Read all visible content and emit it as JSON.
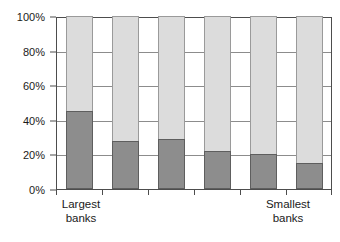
{
  "chart_data": {
    "type": "bar",
    "subtype": "stacked-bar-100-percent",
    "title": "",
    "subtitle": "",
    "xlabel": "",
    "ylabel": "",
    "ylim": [
      0,
      100
    ],
    "yticks": [
      0,
      20,
      40,
      60,
      80,
      100
    ],
    "ytick_labels": [
      "0%",
      "20%",
      "40%",
      "60%",
      "80%",
      "100%"
    ],
    "grid": true,
    "legend": "none",
    "categories": [
      "1",
      "2",
      "3",
      "4",
      "5",
      "6"
    ],
    "category_endpoint_labels": {
      "left": [
        "Largest",
        "banks"
      ],
      "right": [
        "Smallest",
        "banks"
      ]
    },
    "series": [
      {
        "name": "lower-segment",
        "color": "#8d8d8d",
        "values": [
          45,
          28,
          29,
          22,
          20,
          15
        ]
      },
      {
        "name": "upper-segment",
        "color": "#dcdcdc",
        "values": [
          55,
          72,
          71,
          78,
          80,
          85
        ]
      }
    ],
    "bars": [
      {
        "category": "1",
        "lower": 45,
        "upper": 55
      },
      {
        "category": "2",
        "lower": 28,
        "upper": 72
      },
      {
        "category": "3",
        "lower": 29,
        "upper": 71
      },
      {
        "category": "4",
        "lower": 22,
        "upper": 78
      },
      {
        "category": "5",
        "lower": 20,
        "upper": 80
      },
      {
        "category": "6",
        "lower": 15,
        "upper": 85
      }
    ]
  },
  "axis": {
    "y_labels": [
      "100%",
      "80%",
      "60%",
      "40%",
      "20%",
      "0%"
    ]
  },
  "labels": {
    "left_line1": "Largest",
    "left_line2": "banks",
    "right_line1": "Smallest",
    "right_line2": "banks"
  },
  "colors": {
    "lower_fill": "#8d8d8d",
    "lower_stroke": "#5e5e5e",
    "upper_fill": "#dcdcdc",
    "upper_stroke": "#9a9a9a",
    "gridline": "#8c8c8c",
    "axis": "#4d4d4d",
    "background": "#ffffff",
    "text": "#1a1a1a"
  }
}
